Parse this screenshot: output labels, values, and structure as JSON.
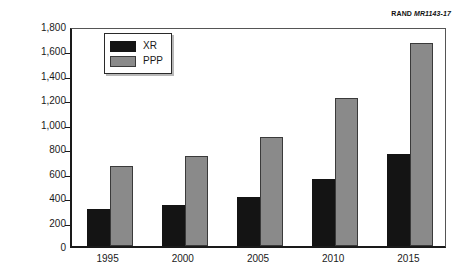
{
  "credit": {
    "organization": "RAND",
    "document_id": "MR1143-17"
  },
  "chart_data": {
    "type": "bar",
    "title": "",
    "xlabel": "",
    "ylabel": "Billions of 1998 U.S. dollars",
    "categories": [
      "1995",
      "2000",
      "2005",
      "2010",
      "2015"
    ],
    "series": [
      {
        "name": "XR",
        "color": "#141414",
        "values": [
          300,
          335,
          400,
          545,
          750
        ]
      },
      {
        "name": "PPP",
        "color": "#8a8a8a",
        "values": [
          655,
          735,
          890,
          1210,
          1660
        ]
      }
    ],
    "ylim": [
      0,
      1800
    ],
    "ytick_step": 200,
    "ytick_labels": [
      "0",
      "200",
      "400",
      "600",
      "800",
      "1,000",
      "1,200",
      "1,400",
      "1,600",
      "1,800"
    ],
    "ytick_values": [
      0,
      200,
      400,
      600,
      800,
      1000,
      1200,
      1400,
      1600,
      1800
    ],
    "grid": false,
    "legend_position": "top-left",
    "legend_entries": [
      "XR",
      "PPP"
    ]
  }
}
